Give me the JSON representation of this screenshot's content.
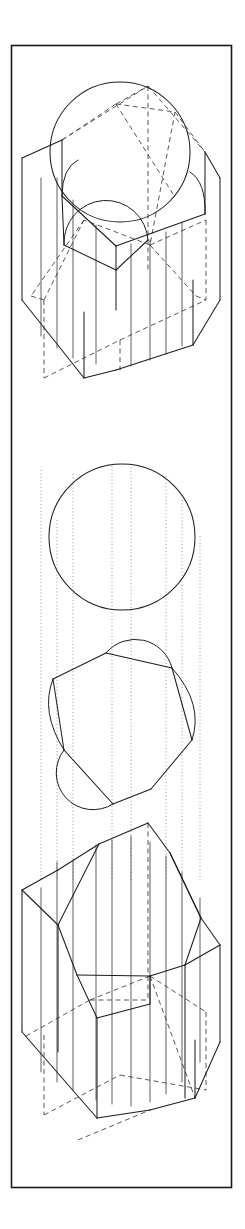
{
  "document": {
    "type": "technical-line-drawing",
    "discipline": "descriptive-geometry",
    "background_color": "#ffffff",
    "ink_color": "#1d1d1d",
    "hidden_line_color": "#3a3a3a",
    "projection_line_color": "#777777",
    "width": 245,
    "height": 1229
  },
  "frame": {
    "name": "plate-border",
    "x": 11,
    "y": 45,
    "width": 221,
    "height": 1143,
    "stroke": "#1a1a1a",
    "stroke_width": 1.6
  },
  "figures": [
    {
      "id": "figure-top",
      "name": "cube-with-inscribed-sphere",
      "caption": "",
      "description": "Axonometric cube with inscribed sphere and hexagonal section plane",
      "bounds": {
        "x": 22,
        "y": 78,
        "width": 198,
        "height": 300
      },
      "elements": [
        {
          "name": "sphere-outline",
          "type": "circle",
          "cx": 120,
          "cy": 152,
          "r": 70
        },
        {
          "name": "cube-visible-edges",
          "type": "polyline"
        },
        {
          "name": "cube-hidden-edges",
          "type": "dashed-polyline"
        },
        {
          "name": "hexagonal-section",
          "type": "polygon"
        },
        {
          "name": "section-arc-front",
          "type": "arc"
        },
        {
          "name": "section-arc-left",
          "type": "arc"
        },
        {
          "name": "section-arc-right",
          "type": "arc"
        }
      ]
    },
    {
      "id": "figure-middle",
      "name": "plan-view-circle-and-hexagon",
      "caption": "",
      "description": "True-shape plan: circle above, hexagon with three semicircular arcs below",
      "bounds": {
        "x": 40,
        "y": 462,
        "width": 165,
        "height": 348
      },
      "elements": [
        {
          "name": "circle-true-shape",
          "type": "circle",
          "cx": 122,
          "cy": 537,
          "r": 73
        },
        {
          "name": "hexagon-true-shape",
          "type": "polygon"
        },
        {
          "name": "hexagon-arc-top",
          "type": "arc"
        },
        {
          "name": "hexagon-arc-bottom",
          "type": "arc"
        },
        {
          "name": "hexagon-arc-left",
          "type": "arc"
        },
        {
          "name": "hexagon-arc-right",
          "type": "arc"
        }
      ]
    },
    {
      "id": "figure-bottom",
      "name": "cube-with-hexagonal-section",
      "caption": "",
      "description": "Axonometric cube cut by a hexagonal plane, hidden edges dashed",
      "bounds": {
        "x": 22,
        "y": 815,
        "width": 198,
        "height": 320
      },
      "elements": [
        {
          "name": "cube-visible-edges",
          "type": "polyline"
        },
        {
          "name": "cube-hidden-edges",
          "type": "dashed-polyline"
        },
        {
          "name": "hexagonal-section",
          "type": "polygon"
        },
        {
          "name": "inner-prism-edges",
          "type": "polyline"
        }
      ]
    }
  ],
  "projection_lines": {
    "name": "vertical-projectors",
    "style": "dotted",
    "x_positions": [
      41,
      57,
      73,
      112,
      131,
      166,
      182,
      200
    ],
    "y_start": 470,
    "y_end": 880
  }
}
